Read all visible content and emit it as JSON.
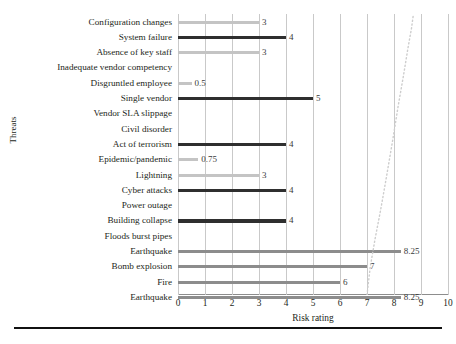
{
  "chart_data": {
    "type": "bar",
    "orientation": "horizontal",
    "title": "",
    "xlabel": "Risk rating",
    "ylabel": "Threats",
    "xlim": [
      0,
      10
    ],
    "xticks": [
      0,
      1,
      2,
      3,
      4,
      5,
      6,
      7,
      8,
      9,
      10
    ],
    "grid": true,
    "legend": "none",
    "categories": [
      "Configuration changes",
      "System failure",
      "Absence of key staff",
      "Inadequate vendor competency",
      "Disgruntled employee",
      "Single vendor",
      "Vendor SLA slippage",
      "Civil disorder",
      "Act of terrorism",
      "Epidemic/pandemic",
      "Lightning",
      "Cyber attacks",
      "Power outage",
      "Building collapse",
      "Floods burst pipes",
      "Earthquake",
      "Bomb explosion",
      "Fire",
      "Earthquake"
    ],
    "values": [
      3,
      4,
      3,
      0,
      0.5,
      5,
      0,
      0,
      4,
      0.75,
      3,
      4,
      0,
      4,
      0,
      8.25,
      7,
      6,
      8.25
    ],
    "value_labels": [
      "3",
      "4",
      "3",
      "",
      "0.5",
      "5",
      "",
      "",
      "4",
      "0.75",
      "3",
      "4",
      "",
      "4",
      "",
      "8.25",
      "7",
      "6",
      "8.25"
    ],
    "bar_colors": [
      "#c4c4c4",
      "#2f2f2f",
      "#c4c4c4",
      "#c4c4c4",
      "#c4c4c4",
      "#2f2f2f",
      "#c4c4c4",
      "#c4c4c4",
      "#2f2f2f",
      "#c4c4c4",
      "#c4c4c4",
      "#2f2f2f",
      "#c4c4c4",
      "#2f2f2f",
      "#c4c4c4",
      "#8c8c8c",
      "#8c8c8c",
      "#8c8c8c",
      "#8c8c8c"
    ],
    "annotation_curve": {
      "style": "dotted",
      "color": "#cdcdcd",
      "points": [
        [
          7.0,
          0.0
        ],
        [
          7.12,
          0.1
        ],
        [
          7.3,
          0.2
        ],
        [
          7.5,
          0.3
        ],
        [
          7.72,
          0.42
        ],
        [
          7.95,
          0.55
        ],
        [
          8.15,
          0.67
        ],
        [
          8.35,
          0.78
        ],
        [
          8.52,
          0.88
        ],
        [
          8.65,
          0.95
        ],
        [
          8.72,
          1.0
        ]
      ]
    }
  },
  "palette": {
    "grid": "#c9c9c9",
    "axis": "#8d8d8d",
    "text": "#231f20",
    "rule": "#111111"
  }
}
